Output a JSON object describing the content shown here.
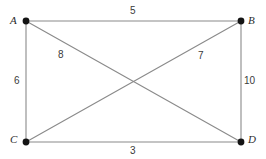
{
  "diagram": {
    "type": "weighted-graph",
    "background_color": "#ffffff",
    "edge_color": "#8a8a8a",
    "vertex_color": "#141414",
    "label_color": "#2b2b2b",
    "weight_color": "#3a3a3a",
    "vertices": [
      {
        "id": "A",
        "label": "A",
        "x": 26,
        "y": 21,
        "label_x": 10,
        "label_y": 15
      },
      {
        "id": "B",
        "label": "B",
        "x": 241,
        "y": 21,
        "label_x": 248,
        "label_y": 15
      },
      {
        "id": "C",
        "label": "C",
        "x": 26,
        "y": 142,
        "label_x": 10,
        "label_y": 134
      },
      {
        "id": "D",
        "label": "D",
        "x": 241,
        "y": 142,
        "label_x": 248,
        "label_y": 134
      }
    ],
    "edges": [
      {
        "id": "AB",
        "from": "A",
        "to": "B",
        "weight": "5",
        "weight_x": 130,
        "weight_y": 6,
        "kind": "side"
      },
      {
        "id": "AC",
        "from": "A",
        "to": "C",
        "weight": "6",
        "weight_x": 14,
        "weight_y": 76,
        "kind": "side"
      },
      {
        "id": "BD",
        "from": "B",
        "to": "D",
        "weight": "10",
        "weight_x": 244,
        "weight_y": 76,
        "kind": "side"
      },
      {
        "id": "CD",
        "from": "C",
        "to": "D",
        "weight": "3",
        "weight_x": 130,
        "weight_y": 146,
        "kind": "side"
      },
      {
        "id": "AD",
        "from": "A",
        "to": "D",
        "weight": "8",
        "weight_x": 58,
        "weight_y": 50,
        "kind": "diagonal"
      },
      {
        "id": "CB",
        "from": "C",
        "to": "B",
        "weight": "7",
        "weight_x": 198,
        "weight_y": 51,
        "kind": "diagonal"
      }
    ]
  }
}
